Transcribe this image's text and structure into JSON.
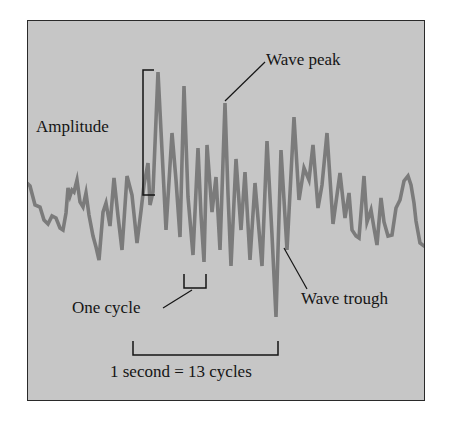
{
  "diagram": {
    "title": "",
    "labels": {
      "amplitude": "Amplitude",
      "wave_peak": "Wave peak",
      "wave_trough": "Wave trough",
      "one_cycle": "One cycle",
      "scale": "1 second = 13 cycles"
    },
    "colors": {
      "background": "#c6c6c6",
      "wave": "#7b7b7b",
      "ink": "#151515",
      "frame": "#2a2a2a"
    },
    "wave_points": "27,183 30,186 35,205 40,207 44,220 48,224 52,216 56,218 60,228 63,230 66,213 68,188 70,196 72,190 74,192 77,180 80,202 83,207 86,193 89,215 93,236 96,247 99,260 103,212 106,203 110,226 114,178 118,216 122,250 127,176 132,195 137,243 141,211 144,185 148,163 150,205 153,192 158,72 163,170 166,230 172,133 176,180 180,237 184,86 188,197 193,255 198,148 201,215 204,262 207,145 212,212 216,177 220,250 225,103 228,194 231,266 236,159 241,230 245,172 250,260 255,183 262,266 267,141 272,235 276,317 281,150 284,200 287,250 294,117 299,200 304,168 309,180 313,145 318,208 322,185 327,133 333,224 340,173 345,218 349,193 352,230 356,236 359,238 364,176 367,222 371,210 374,228 377,245 381,198 384,222 388,236 392,235 396,208 400,200 404,181 408,176 411,185 414,203 416,221 420,243 424,246 426,247",
    "annotations": {
      "amplitude_bracket": {
        "x": 146,
        "y_top": 70,
        "y_bottom": 195
      },
      "one_cycle_bracket": {
        "x1": 184,
        "x2": 205,
        "y": 287
      },
      "scale_bracket": {
        "x1": 133,
        "x2": 278,
        "y": 354
      }
    }
  }
}
